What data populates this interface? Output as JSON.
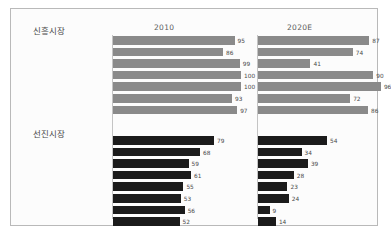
{
  "chart_data": {
    "type": "bar",
    "title": "",
    "xlabel": "",
    "ylabel": "",
    "grid": false,
    "legend_position": "top",
    "xlim": [
      0,
      100
    ],
    "panels": [
      {
        "key": "p2010",
        "label": "2010"
      },
      {
        "key": "p2020",
        "label": "2020E"
      }
    ],
    "groups": [
      {
        "name": "신흥시장",
        "color": "#8a8a8a",
        "categories": [
          "아르헨티나",
          "브라질",
          "중국",
          "인도",
          "인도네시아",
          "말레이시아",
          "멕시코"
        ],
        "series": [
          {
            "name": "2010",
            "values": [
              95,
              86,
              99,
              100,
              100,
              93,
              97
            ]
          },
          {
            "name": "2020E",
            "values": [
              87,
              74,
              41,
              90,
              96,
              72,
              86
            ]
          }
        ]
      },
      {
        "name": "선진시장",
        "color": "#1b1b1b",
        "categories": [
          "일본",
          "한국",
          "싱가포르",
          "미국",
          "영국",
          "핀란드",
          "스웨덴",
          "네덜란드"
        ],
        "series": [
          {
            "name": "2010",
            "values": [
              79,
              68,
              59,
              61,
              55,
              53,
              56,
              52
            ]
          },
          {
            "name": "2020E",
            "values": [
              54,
              34,
              39,
              28,
              23,
              24,
              9,
              14
            ]
          }
        ]
      }
    ]
  },
  "header": {
    "col_2010": "2010",
    "col_2020": "2020E"
  },
  "groups": {
    "emerging_title": "신흥시장",
    "developed_title": "선진시장"
  }
}
